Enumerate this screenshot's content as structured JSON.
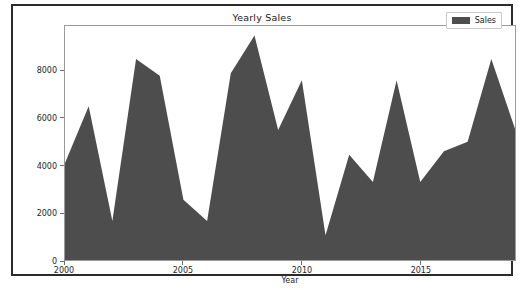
{
  "figure": {
    "title": "Yearly Sales",
    "background": "#ffffff",
    "frame_color": "#2b2b2b"
  },
  "legend": {
    "position": "upper-right",
    "entries": [
      {
        "label": "Sales",
        "color": "#4d4d4d",
        "swatch": "legend-swatch-sales"
      }
    ]
  },
  "chart_data": {
    "type": "area",
    "title": "Yearly Sales",
    "xlabel": "Year",
    "ylabel": "",
    "x": [
      2000,
      2001,
      2002,
      2003,
      2004,
      2005,
      2006,
      2007,
      2008,
      2009,
      2010,
      2011,
      2012,
      2013,
      2014,
      2015,
      2016,
      2017,
      2018,
      2019
    ],
    "series": [
      {
        "name": "Sales",
        "color": "#4d4d4d",
        "values": [
          4100,
          6500,
          1650,
          8500,
          7800,
          2550,
          1650,
          7900,
          9500,
          5500,
          7600,
          1050,
          4450,
          3300,
          7600,
          3300,
          4600,
          5000,
          8500,
          5550
        ]
      }
    ],
    "xlim": [
      2000,
      2019
    ],
    "ylim": [
      0,
      9900
    ],
    "xticks": [
      2000,
      2005,
      2010,
      2015
    ],
    "xticklabels": [
      "2000",
      "2005",
      "2010",
      "2015"
    ],
    "yticks": [
      0,
      2000,
      4000,
      6000,
      8000
    ],
    "yticklabels": [
      "0",
      "2000",
      "4000",
      "6000",
      "8000"
    ],
    "grid": false,
    "legend_position": "upper right"
  }
}
